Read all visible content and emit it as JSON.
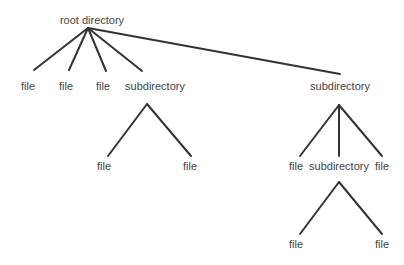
{
  "diagram": {
    "type": "directory-tree",
    "colors": {
      "edge": "#333333",
      "text": "#444444",
      "background": "#ffffff"
    },
    "nodes": [
      {
        "id": "root",
        "label": "root directory",
        "x": 92,
        "y": 24,
        "anchor_x": 88,
        "anchor_y": 28
      },
      {
        "id": "f1",
        "label": "file",
        "x": 28,
        "y": 90,
        "parent": "root",
        "edge_x": 34,
        "edge_y": 70
      },
      {
        "id": "f2",
        "label": "file",
        "x": 66,
        "y": 90,
        "parent": "root",
        "edge_x": 69,
        "edge_y": 70
      },
      {
        "id": "f3",
        "label": "file",
        "x": 103,
        "y": 90,
        "parent": "root",
        "edge_x": 106,
        "edge_y": 71
      },
      {
        "id": "sd1",
        "label": "subdirectory",
        "x": 155,
        "y": 90,
        "parent": "root",
        "edge_x": 142,
        "edge_y": 71,
        "anchor_x": 147,
        "anchor_y": 104
      },
      {
        "id": "sd2",
        "label": "subdirectory",
        "x": 340,
        "y": 90,
        "parent": "root",
        "edge_x": 340,
        "edge_y": 74,
        "anchor_x": 339,
        "anchor_y": 105
      },
      {
        "id": "f4",
        "label": "file",
        "x": 104,
        "y": 170,
        "parent": "sd1",
        "edge_x": 108,
        "edge_y": 156
      },
      {
        "id": "f5",
        "label": "file",
        "x": 190,
        "y": 170,
        "parent": "sd1",
        "edge_x": 191,
        "edge_y": 156
      },
      {
        "id": "f6",
        "label": "file",
        "x": 296,
        "y": 170,
        "parent": "sd2",
        "edge_x": 300,
        "edge_y": 156
      },
      {
        "id": "sd3",
        "label": "subdirectory",
        "x": 339,
        "y": 170,
        "parent": "sd2",
        "edge_x": 339,
        "edge_y": 156,
        "anchor_x": 339,
        "anchor_y": 182
      },
      {
        "id": "f7",
        "label": "file",
        "x": 382,
        "y": 170,
        "parent": "sd2",
        "edge_x": 382,
        "edge_y": 156
      },
      {
        "id": "f8",
        "label": "file",
        "x": 296,
        "y": 248,
        "parent": "sd3",
        "edge_x": 300,
        "edge_y": 234
      },
      {
        "id": "f9",
        "label": "file",
        "x": 382,
        "y": 248,
        "parent": "sd3",
        "edge_x": 382,
        "edge_y": 234
      }
    ]
  }
}
